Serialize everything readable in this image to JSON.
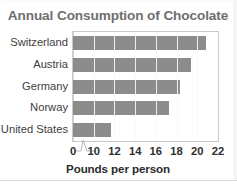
{
  "chart_data": {
    "type": "bar",
    "orientation": "horizontal",
    "title": "Annual Consumption of Chocolate",
    "xlabel": "Pounds per person",
    "ylabel": "",
    "categories": [
      "Switzerland",
      "Austria",
      "Germany",
      "Norway",
      "United States"
    ],
    "values": [
      20.8,
      19.4,
      18.3,
      17.3,
      11.7
    ],
    "xlim": [
      0,
      22
    ],
    "axis_break": true,
    "axis_break_between": [
      0,
      10
    ],
    "xticks": [
      0,
      10,
      12,
      14,
      16,
      18,
      20,
      22
    ],
    "xtick_labels": [
      "0",
      "10",
      "12",
      "14",
      "16",
      "18",
      "20",
      "22"
    ],
    "grid": "vertical",
    "legend": "none",
    "bar_color": "#8c8c8c",
    "title_color": "#6e6e6e",
    "grid_color": "#d8d8d8",
    "frame_color": "#c9c9c9",
    "background": "#ffffff"
  },
  "caption_fragment": "cut-off text line below chart"
}
